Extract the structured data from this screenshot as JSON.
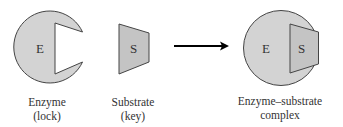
{
  "diagram": {
    "colors": {
      "shape_fill": "#d3d3d3",
      "substrate_fill": "#c4c4c4",
      "stroke": "#444444",
      "arrow": "#000000",
      "text": "#333333"
    },
    "enzyme": {
      "glyph": "E",
      "label_line1": "Enzyme",
      "label_line2": "(lock)"
    },
    "substrate": {
      "glyph": "S",
      "label_line1": "Substrate",
      "label_line2": "(key)"
    },
    "arrow": {
      "direction": "right"
    },
    "complex": {
      "glyph_enzyme": "E",
      "glyph_substrate": "S",
      "label_line1": "Enzyme–substrate",
      "label_line2": "complex"
    }
  }
}
